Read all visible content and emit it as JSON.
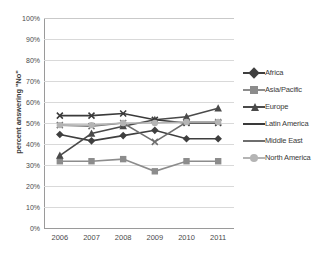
{
  "chart_data": {
    "type": "line",
    "title": "",
    "xlabel": "",
    "ylabel": "percent answering \"No\"",
    "x": [
      "2006",
      "2007",
      "2008",
      "2009",
      "2010",
      "2011"
    ],
    "categories": [
      "2006",
      "2007",
      "2008",
      "2009",
      "2010",
      "2011"
    ],
    "ylim": [
      0,
      100
    ],
    "yticks": [
      "0%",
      "10%",
      "20%",
      "30%",
      "40%",
      "50%",
      "60%",
      "70%",
      "80%",
      "90%",
      "100%"
    ],
    "ytick_values": [
      0,
      10,
      20,
      30,
      40,
      50,
      60,
      70,
      80,
      90,
      100
    ],
    "grid": true,
    "legend_position": "right",
    "series": [
      {
        "name": "Africa",
        "marker": "diamond",
        "color": "#3f3f3f",
        "values": [
          44.5,
          41.5,
          44.0,
          46.5,
          42.5,
          42.5
        ]
      },
      {
        "name": "Asia/Pacific",
        "marker": "square",
        "color": "#8c8c8c",
        "values": [
          31.8,
          31.8,
          32.8,
          27.0,
          31.8,
          31.8
        ]
      },
      {
        "name": "Europe",
        "marker": "triangle",
        "color": "#4a4a4a",
        "values": [
          34.5,
          45.0,
          48.5,
          51.5,
          53.0,
          57.0
        ]
      },
      {
        "name": "Latin America",
        "marker": "none",
        "color": "#3a3a3a",
        "values": [
          53.5,
          53.5,
          54.5,
          51.5,
          50.0,
          50.0
        ]
      },
      {
        "name": "Middle East",
        "marker": "none",
        "color": "#6e6e6e",
        "values": [
          49.0,
          48.5,
          50.0,
          41.0,
          50.5,
          50.5
        ]
      },
      {
        "name": "North America",
        "marker": "circle",
        "color": "#b4b4b4",
        "values": [
          49.0,
          49.0,
          50.0,
          50.0,
          50.5,
          50.5
        ]
      }
    ]
  },
  "legend": {
    "items": [
      {
        "label": "Africa"
      },
      {
        "label": "Asia/Pacific"
      },
      {
        "label": "Europe"
      },
      {
        "label": "Latin America"
      },
      {
        "label": "Middle East"
      },
      {
        "label": "North America"
      }
    ]
  },
  "colors": {
    "gridline": "#d9d9d9",
    "axis": "#9a9a9a",
    "text": "#3a3a3a",
    "background": "#ffffff"
  }
}
